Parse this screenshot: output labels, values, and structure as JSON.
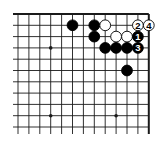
{
  "game": "Go",
  "view": "top-right corner",
  "board": {
    "visible_columns": 13,
    "visible_rows": 11,
    "edges": [
      "top",
      "right"
    ],
    "star_points": [
      {
        "col": 3,
        "row": 3
      },
      {
        "col": 9,
        "row": 3
      },
      {
        "col": 3,
        "row": 9
      },
      {
        "col": 9,
        "row": 9
      }
    ]
  },
  "stones": [
    {
      "color": "black",
      "col": 5,
      "row": 1,
      "label": ""
    },
    {
      "color": "black",
      "col": 7,
      "row": 1,
      "label": ""
    },
    {
      "color": "white",
      "col": 8,
      "row": 1,
      "label": ""
    },
    {
      "color": "white",
      "col": 11,
      "row": 1,
      "label": "2"
    },
    {
      "color": "white",
      "col": 12,
      "row": 1,
      "label": "4"
    },
    {
      "color": "black",
      "col": 7,
      "row": 2,
      "label": ""
    },
    {
      "color": "white",
      "col": 9,
      "row": 2,
      "label": ""
    },
    {
      "color": "white",
      "col": 10,
      "row": 2,
      "label": ""
    },
    {
      "color": "black",
      "col": 11,
      "row": 2,
      "label": "1"
    },
    {
      "color": "black",
      "col": 8,
      "row": 3,
      "label": ""
    },
    {
      "color": "black",
      "col": 9,
      "row": 3,
      "label": ""
    },
    {
      "color": "black",
      "col": 10,
      "row": 3,
      "label": ""
    },
    {
      "color": "black",
      "col": 11,
      "row": 3,
      "label": "3"
    },
    {
      "color": "black",
      "col": 10,
      "row": 5,
      "label": ""
    }
  ],
  "colors": {
    "line": "#1a1a1a",
    "black_stone": "#000000",
    "white_stone": "#ffffff",
    "background": "#ffffff"
  }
}
